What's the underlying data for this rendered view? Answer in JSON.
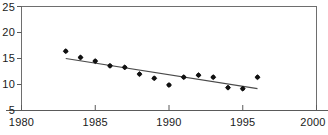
{
  "chart_data": {
    "type": "scatter",
    "title": "",
    "subtitle": "",
    "xlabel": "",
    "ylabel": "",
    "xlim": [
      1980,
      2000
    ],
    "ylim": [
      5,
      25
    ],
    "xticks": [
      1980,
      1985,
      1990,
      1995,
      2000
    ],
    "yticks": [
      5,
      10,
      15,
      20,
      25
    ],
    "xtick_labels": [
      "1980",
      "1985",
      "1990",
      "1995",
      "2000"
    ],
    "ytick_labels": [
      "5",
      "10",
      "15",
      "20",
      "25"
    ],
    "grid": false,
    "legend": null,
    "x": [
      1983,
      1984,
      1985,
      1986,
      1987,
      1988,
      1989,
      1990,
      1991,
      1992,
      1993,
      1994,
      1995,
      1996
    ],
    "values": [
      16.4,
      15.2,
      14.5,
      13.6,
      13.3,
      12.0,
      11.2,
      9.9,
      11.4,
      11.8,
      11.4,
      9.4,
      9.2,
      11.4
    ],
    "series": [
      {
        "name": "observations",
        "type": "scatter",
        "marker": "diamond",
        "color": "#111111",
        "x": [
          1983,
          1984,
          1985,
          1986,
          1987,
          1988,
          1989,
          1990,
          1991,
          1992,
          1993,
          1994,
          1995,
          1996
        ],
        "values": [
          16.4,
          15.2,
          14.5,
          13.6,
          13.3,
          12.0,
          11.2,
          9.9,
          11.4,
          11.8,
          11.4,
          9.4,
          9.2,
          11.4
        ]
      },
      {
        "name": "trend-line",
        "type": "line",
        "color": "#4a4a4a",
        "x": [
          1983,
          1996
        ],
        "values": [
          15.0,
          9.2
        ]
      }
    ],
    "annotations": []
  },
  "axes": {
    "y_axis_name": "y-axis",
    "x_axis_name": "x-axis"
  }
}
